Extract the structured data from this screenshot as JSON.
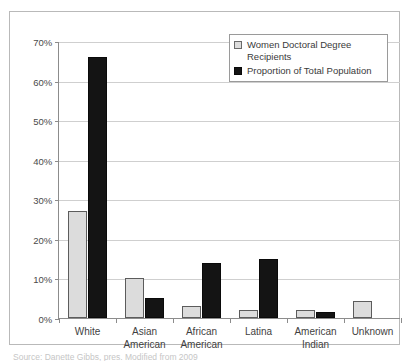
{
  "chart_data": {
    "type": "bar",
    "title": "",
    "xlabel": "",
    "ylabel": "",
    "ylim": [
      0,
      70
    ],
    "ytick_values": [
      0,
      10,
      20,
      30,
      40,
      50,
      60,
      70
    ],
    "ytick_labels": [
      "0%",
      "10%",
      "20%",
      "30%",
      "40%",
      "50%",
      "60%",
      "70%"
    ],
    "grid": true,
    "legend_position": "top-right",
    "categories": [
      "White",
      "Asian\nAmerican",
      "African\nAmerican",
      "Latina",
      "American\nIndian",
      "Unknown"
    ],
    "series": [
      {
        "name": "Women Doctoral Degree Recipients",
        "color": "#dcdcdc",
        "values": [
          27,
          10,
          3,
          2,
          2,
          4.2
        ]
      },
      {
        "name": "Proportion of Total Population",
        "color": "#141414",
        "values": [
          66,
          5,
          14,
          15,
          1.5,
          0
        ]
      }
    ]
  },
  "legend": {
    "entries": [
      {
        "label": "Women Doctoral Degree Recipients",
        "swatch": "light"
      },
      {
        "label": "Proportion of Total Population",
        "swatch": "dark"
      }
    ]
  },
  "caption": {
    "source_text": "Source: Danette Gibbs, pres. Modified from 2009"
  },
  "colors": {
    "series_light": "#dcdcdc",
    "series_dark": "#141414",
    "gridline": "#cfcfcf",
    "axis": "#8c8c8c",
    "frame": "#b9b9b9",
    "text": "#3a3a3a"
  }
}
